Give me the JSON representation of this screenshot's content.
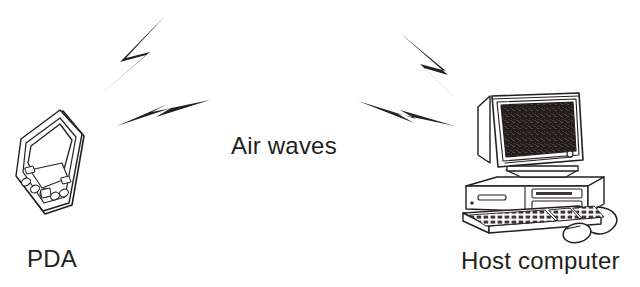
{
  "figure": {
    "background_color": "#ffffff",
    "ink_color": "#231f20",
    "width": 640,
    "height": 287
  },
  "labels": {
    "air_waves": "Air waves",
    "pda": "PDA",
    "host_computer": "Host computer"
  },
  "objects": {
    "pda": {
      "name": "PDA",
      "description": "handheld personal digital assistant tilted at an angle"
    },
    "host": {
      "name": "Host computer",
      "description": "desktop CRT monitor on a horizontal tower case with keyboard and mouse"
    }
  },
  "signals": {
    "bolts": [
      {
        "id": "bolt-upper-left",
        "direction": "up-right",
        "side": "pda"
      },
      {
        "id": "bolt-lower-left",
        "direction": "right",
        "side": "pda"
      },
      {
        "id": "bolt-upper-right",
        "direction": "down-right",
        "side": "host"
      },
      {
        "id": "bolt-lower-right",
        "direction": "left",
        "side": "host"
      }
    ]
  },
  "colors": {
    "ink": "#231f20",
    "bolt_fill": "#231f20",
    "screen_fill": "#2b2320",
    "case_fill": "#ffffff",
    "shade_fill": "#d8d8d8"
  }
}
